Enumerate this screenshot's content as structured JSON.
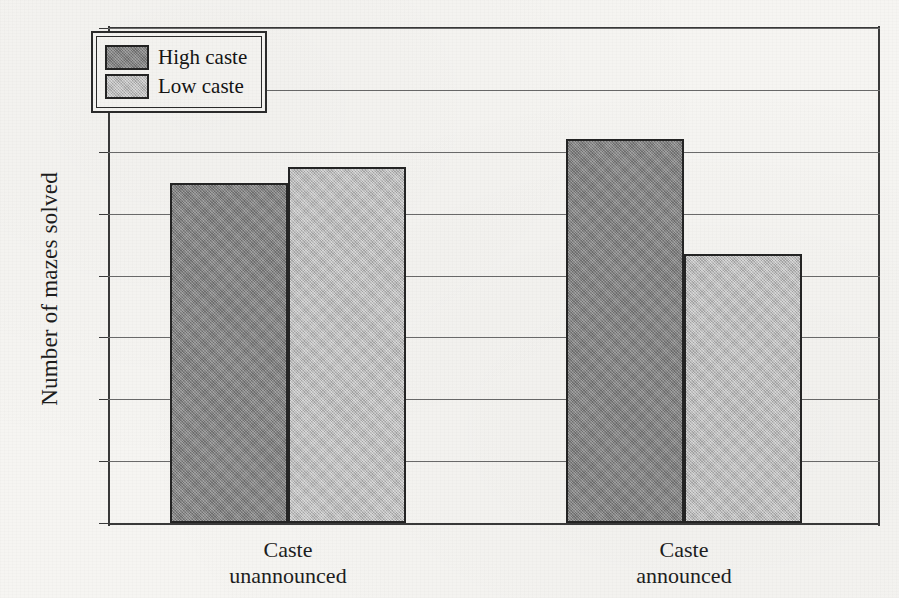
{
  "chart_data": {
    "type": "bar",
    "title": "",
    "xlabel": "",
    "ylabel": "Number of mazes solved",
    "categories": [
      "Caste unannounced",
      "Caste announced"
    ],
    "category_lines": [
      [
        "Caste",
        "unannounced"
      ],
      [
        "Caste",
        "announced"
      ]
    ],
    "series": [
      {
        "name": "High caste",
        "color": "#858585",
        "values": [
          5.5,
          6.2
        ]
      },
      {
        "name": "Low caste",
        "color": "#bcbcbc",
        "values": [
          5.75,
          4.35
        ]
      }
    ],
    "ylim": [
      0,
      8
    ],
    "yticks": [
      0,
      1,
      2,
      3,
      4,
      5,
      6,
      7,
      8
    ],
    "ytick_labels": [
      "0",
      "1",
      "2",
      "3",
      "4",
      "5",
      "6",
      "7",
      "8"
    ],
    "grid": true,
    "grid_axis": "y",
    "legend_position": "top-left",
    "bar_edge_color": "#242424",
    "background_color": "#f6f5f2"
  },
  "axis": {
    "y_title": "Number of mazes solved"
  },
  "legend": {
    "entries": [
      {
        "label": "High caste",
        "swatch": "dark-gray-swatch"
      },
      {
        "label": "Low caste",
        "swatch": "light-gray-swatch"
      }
    ]
  }
}
